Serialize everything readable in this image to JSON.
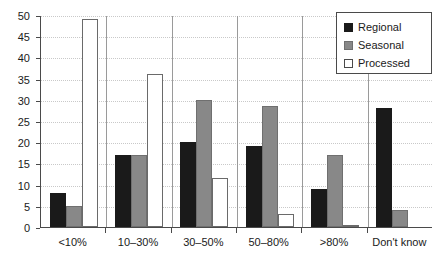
{
  "chart_data": {
    "type": "bar",
    "title": "",
    "subtitle": "",
    "xlabel": "",
    "ylabel": "",
    "ylim": [
      0,
      50
    ],
    "ytick_step": 5,
    "yticks": [
      0,
      5,
      10,
      15,
      20,
      25,
      30,
      35,
      40,
      45,
      50
    ],
    "grid": true,
    "grid_axis": "y",
    "legend_position": "top-right",
    "categories": [
      "<10%",
      "10–30%",
      "30–50%",
      "50–80%",
      ">80%",
      "Don't know"
    ],
    "series": [
      {
        "name": "Regional",
        "color": "#1a1a1a",
        "values": [
          8,
          17,
          20,
          19,
          9,
          28
        ]
      },
      {
        "name": "Seasonal",
        "color": "#888888",
        "values": [
          5,
          17,
          30,
          28.5,
          17,
          4
        ]
      },
      {
        "name": "Processed",
        "color": "#ffffff",
        "values": [
          49,
          36,
          11.5,
          3,
          0.5,
          0
        ]
      }
    ]
  },
  "legend": {
    "items": [
      {
        "label": "Regional",
        "swatch": "regional"
      },
      {
        "label": "Seasonal",
        "swatch": "seasonal"
      },
      {
        "label": "Processed",
        "swatch": "processed"
      }
    ]
  },
  "axes": {
    "y_tick_labels": [
      "0",
      "5",
      "10",
      "15",
      "20",
      "25",
      "30",
      "35",
      "40",
      "45",
      "50"
    ],
    "x_tick_labels": [
      "<10%",
      "10–30%",
      "30–50%",
      "50–80%",
      ">80%",
      "Don't know"
    ]
  }
}
